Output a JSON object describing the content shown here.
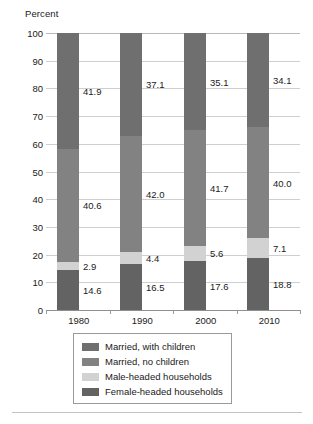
{
  "chart_data": {
    "type": "bar",
    "subtype": "stacked-bar-100",
    "title": "",
    "xlabel": "",
    "ylabel": "Percent",
    "ylim": [
      0,
      100
    ],
    "ytick_step": 10,
    "yticks": [
      "100",
      "90",
      "80",
      "70",
      "60",
      "50",
      "40",
      "30",
      "20",
      "10",
      "0"
    ],
    "grid": true,
    "legend_position": "bottom-center",
    "categories": [
      "1980",
      "1990",
      "2000",
      "2010"
    ],
    "series": [
      {
        "name": "Married, with children",
        "color": "#6f6f6f",
        "values": [
          41.9,
          37.1,
          35.1,
          34.1
        ],
        "labels": [
          "41.9",
          "37.1",
          "35.1",
          "34.1"
        ]
      },
      {
        "name": "Married, no children",
        "color": "#828282",
        "values": [
          40.6,
          42.0,
          41.7,
          40.0
        ],
        "labels": [
          "40.6",
          "42.0",
          "41.7",
          "40.0"
        ]
      },
      {
        "name": "Male-headed households",
        "color": "#d2d2d2",
        "values": [
          2.9,
          4.4,
          5.6,
          7.1
        ],
        "labels": [
          "2.9",
          "4.4",
          "5.6",
          "7.1"
        ]
      },
      {
        "name": "Female-headed households",
        "color": "#636363",
        "values": [
          14.6,
          16.5,
          17.6,
          18.8
        ],
        "labels": [
          "14.6",
          "16.5",
          "17.6",
          "18.8"
        ]
      }
    ]
  },
  "axis": {
    "y_title": "Percent"
  },
  "legend": {
    "items": [
      {
        "label": "Married, with children",
        "color": "#6f6f6f"
      },
      {
        "label": "Married, no children",
        "color": "#828282"
      },
      {
        "label": "Male-headed households",
        "color": "#d2d2d2"
      },
      {
        "label": "Female-headed households",
        "color": "#636363"
      }
    ]
  }
}
